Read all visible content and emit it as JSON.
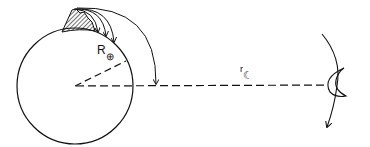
{
  "diagram": {
    "title": "",
    "labels": {
      "earth_radius_symbol": "R",
      "earth_radius_subscript": "⊕",
      "earth_moon_distance_symbol": "r",
      "earth_moon_distance_subscript": "☾"
    },
    "elements": [
      "earth-circle",
      "earth-radius-dashed-line",
      "earth-moon-distance-dashed-line",
      "mountain-peak-hatched",
      "projectile-trajectory-arrows",
      "moon-crescent",
      "moon-orbit-arc-arrow"
    ],
    "colors": {
      "stroke": "#111111",
      "background": "#ffffff"
    }
  }
}
